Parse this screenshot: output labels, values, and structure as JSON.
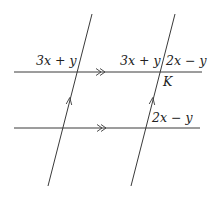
{
  "diagram": {
    "colors": {
      "line": "#3a3a3a",
      "text": "#222222",
      "background": "#ffffff"
    },
    "parallel_lines": [
      {
        "name": "top-horizontal-line",
        "x1": 14,
        "y1": 72,
        "x2": 202,
        "y2": 72,
        "marker": "double-chevron",
        "marker_x": 100
      },
      {
        "name": "bottom-horizontal-line",
        "x1": 14,
        "y1": 128,
        "x2": 200,
        "y2": 128,
        "marker": "double-chevron",
        "marker_x": 105
      }
    ],
    "transversals": [
      {
        "name": "left-transversal",
        "x1": 92,
        "y1": 14,
        "x2": 48,
        "y2": 186,
        "marker": "single-arrow",
        "marker_y": 98
      },
      {
        "name": "right-transversal",
        "x1": 175,
        "y1": 14,
        "x2": 131,
        "y2": 186,
        "marker": "single-arrow",
        "marker_y": 98
      }
    ],
    "labels": {
      "top_left_angle": "3x + y",
      "top_right_left_angle": "3x + y",
      "top_right_right_angle": "2x − y",
      "point_k": "K",
      "bottom_right_angle": "2x − y"
    }
  }
}
